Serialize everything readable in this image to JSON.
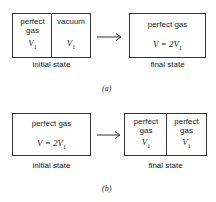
{
  "panel_a": {
    "label": "(a)",
    "initial": {
      "caption": "initial state",
      "left": {
        "text1": "perfect",
        "text2": "gas",
        "volume": "V",
        "volume_sub": "1"
      },
      "right": {
        "text1": "vacuum",
        "volume": "V",
        "volume_sub": "1"
      }
    },
    "final": {
      "caption": "final state",
      "text": "perfect gas",
      "volume": "V = 2V",
      "volume_sub": "1"
    }
  },
  "panel_b": {
    "label": "(b)",
    "initial": {
      "caption": "initial state",
      "text": "perfect gas",
      "volume": "V = 2V",
      "volume_sub": "1"
    },
    "final": {
      "caption": "final state",
      "left": {
        "text1": "perfect",
        "text2": "gas",
        "volume": "V",
        "volume_sub": "1"
      },
      "right": {
        "text1": "perfect",
        "text2": "gas",
        "volume": "V",
        "volume_sub": "1"
      }
    }
  }
}
